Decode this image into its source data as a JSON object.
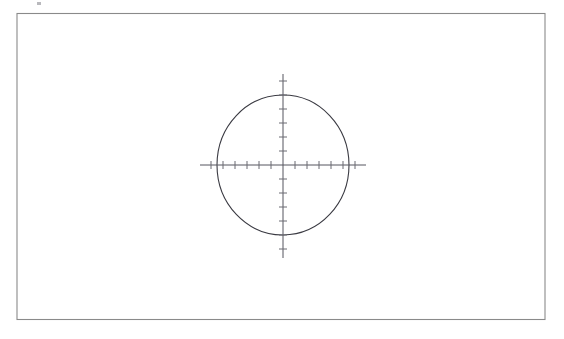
{
  "document": {
    "title": "Ellipse with crossed axes diagram",
    "width": 564,
    "height": 339,
    "background_color": "#ffffff"
  },
  "colors": {
    "background": "#ffffff",
    "frame_stroke": "#8a8a8a",
    "ellipse_stroke": "#3a3a42",
    "axis_stroke": "#55555e",
    "tick_stroke": "#6a6a72",
    "artifact": "#b9b9bd"
  },
  "frame": {
    "name": "page-border",
    "x": 17,
    "y": 13.5,
    "width": 528,
    "height": 306,
    "stroke_width": 1.1,
    "fill": "none"
  },
  "artifact": {
    "name": "scan-speck",
    "x": 37,
    "y": 2,
    "width": 4,
    "height": 3
  },
  "chart_data": {
    "type": "scatter",
    "title": "",
    "subtitle": "",
    "xlabel": "",
    "ylabel": "",
    "grid": false,
    "legend": null,
    "annotations": [],
    "tick_labels_x": [],
    "tick_labels_y": [],
    "shapes": [
      {
        "name": "ellipse-outline",
        "type": "ellipse",
        "cx": 283,
        "cy": 165,
        "rx": 66,
        "ry": 70,
        "stroke_width": 1.1,
        "fill": "none"
      }
    ],
    "axes": {
      "x_axis": {
        "name": "horizontal-axis",
        "y": 165,
        "x_start": 200,
        "x_end": 366,
        "stroke_width": 1.0,
        "ticks": {
          "count": 13,
          "spacing": 12,
          "half_length": 4,
          "positions": [
            211,
            223,
            235,
            247,
            259,
            271,
            283,
            295,
            307,
            319,
            331,
            343,
            355
          ]
        }
      },
      "y_axis": {
        "name": "vertical-axis",
        "x": 283,
        "y_start": 74,
        "y_end": 258,
        "stroke_width": 1.0,
        "ticks": {
          "count": 13,
          "spacing": 14,
          "half_length": 4,
          "positions": [
            81,
            95,
            109,
            123,
            137,
            151,
            165,
            179,
            193,
            207,
            221,
            235,
            249
          ]
        }
      }
    },
    "xlim": [
      200,
      366
    ],
    "ylim": [
      74,
      258
    ]
  }
}
